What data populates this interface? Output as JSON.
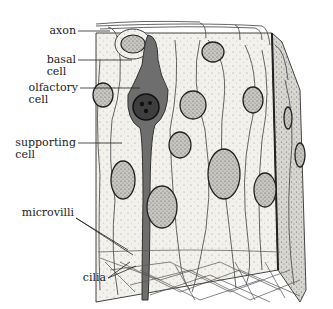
{
  "diagram": {
    "labels": [
      {
        "id": "axon",
        "line1": "axon",
        "line2": ""
      },
      {
        "id": "basal-cell",
        "line1": "basal",
        "line2": "cell"
      },
      {
        "id": "olfactory-cell",
        "line1": "olfactory",
        "line2": "cell"
      },
      {
        "id": "supporting-cell",
        "line1": "supporting",
        "line2": "cell"
      },
      {
        "id": "microvilli",
        "line1": "microvilli",
        "line2": ""
      },
      {
        "id": "cilia",
        "line1": "cilia",
        "line2": ""
      }
    ],
    "colors": {
      "olfactory_cell_fill": "#6e6e6e",
      "outline": "#333333",
      "tissue_fill": "#f4f2ee",
      "nucleus_fill": "#9a9a9a"
    }
  }
}
